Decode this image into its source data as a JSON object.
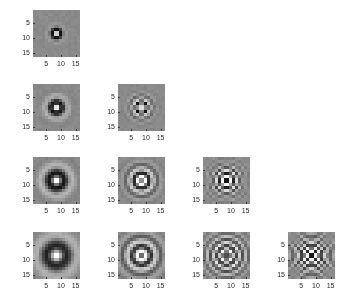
{
  "figure": {
    "title": "",
    "background_color": "#ffffff",
    "width": 364,
    "height": 305,
    "layout": "lower-triangular grid, 4 rows x 4 columns, 10 panels"
  },
  "axis": {
    "x_ticks": [
      "5",
      "10",
      "15"
    ],
    "y_ticks": [
      "5",
      "10",
      "15"
    ],
    "x_tick_values": [
      5,
      10,
      15
    ],
    "y_tick_values": [
      5,
      10,
      15
    ],
    "x_range": [
      1,
      16
    ],
    "y_range": [
      1,
      16
    ],
    "tick_color": "#2b2b2b",
    "tick_font_size": 7
  },
  "colormap": {
    "name": "gray",
    "low_color": "#000000",
    "mid_color": "#8a8a8a",
    "high_color": "#ffffff"
  },
  "chart_data": {
    "type": "heatmap",
    "title": "",
    "xlabel": "",
    "ylabel": "",
    "grid": false,
    "legend": "none",
    "colormap": "gray",
    "image_size": [
      16,
      16
    ],
    "xlim": [
      1,
      16
    ],
    "ylim": [
      1,
      16
    ],
    "xticks": [
      5,
      10,
      15
    ],
    "yticks": [
      5,
      10,
      15
    ],
    "grid_shape": [
      4,
      4
    ],
    "grid_type": "lower-triangular",
    "panel_count": 10,
    "panels": [
      {
        "id": "panel-r1c1",
        "row": 1,
        "col": 1,
        "sigma": 1.5,
        "frequency": 0.55,
        "rings": 1,
        "center_value": 1.0,
        "description": "tiny bright center dot with a single dark ring, flat mid-gray surround"
      },
      {
        "id": "panel-r2c1",
        "row": 2,
        "col": 1,
        "sigma": 2.4,
        "frequency": 0.45,
        "rings": 1,
        "center_value": 1.0,
        "description": "bright center blob with one broad dark ring"
      },
      {
        "id": "panel-r2c2",
        "row": 2,
        "col": 2,
        "sigma": 2.4,
        "frequency": 0.95,
        "rings": 2,
        "center_value": -1.0,
        "description": "dark checkered center with bright surrounding ring, two visible cycles"
      },
      {
        "id": "panel-r3c1",
        "row": 3,
        "col": 1,
        "sigma": 3.4,
        "frequency": 0.34,
        "rings": 1,
        "center_value": 1.0,
        "description": "large soft bright center with a single wide dark ring"
      },
      {
        "id": "panel-r3c2",
        "row": 3,
        "col": 2,
        "sigma": 3.4,
        "frequency": 0.72,
        "rings": 2,
        "center_value": -1.0,
        "description": "dark center with bright ring and faint outer dark ring"
      },
      {
        "id": "panel-r3c3",
        "row": 3,
        "col": 3,
        "sigma": 3.4,
        "frequency": 1.15,
        "rings": 3,
        "center_value": 1.0,
        "description": "bright center dot with multiple alternating concentric rings"
      },
      {
        "id": "panel-r4c1",
        "row": 4,
        "col": 1,
        "sigma": 4.6,
        "frequency": 0.26,
        "rings": 1,
        "center_value": 1.0,
        "description": "very large soft bright blob with broad dark halo filling the tile"
      },
      {
        "id": "panel-r4c2",
        "row": 4,
        "col": 2,
        "sigma": 4.6,
        "frequency": 0.6,
        "rings": 2,
        "center_value": -1.0,
        "description": "bright core inside a thick dark annulus, then a bright outer ring"
      },
      {
        "id": "panel-r4c3",
        "row": 4,
        "col": 3,
        "sigma": 4.6,
        "frequency": 0.92,
        "rings": 3,
        "center_value": 1.0,
        "description": "bright square center, dark ring, bright ring, dark outer ring"
      },
      {
        "id": "panel-r4c4",
        "row": 4,
        "col": 4,
        "sigma": 4.6,
        "frequency": 1.35,
        "rings": 4,
        "center_value": 1.0,
        "description": "many tight alternating concentric rings, highest radial frequency"
      }
    ]
  },
  "panel_geometry": [
    {
      "id": "panel-r1c1",
      "left": 33,
      "top": 10,
      "size": 47
    },
    {
      "id": "panel-r2c1",
      "left": 33,
      "top": 84,
      "size": 47
    },
    {
      "id": "panel-r2c2",
      "left": 118,
      "top": 84,
      "size": 47
    },
    {
      "id": "panel-r3c1",
      "left": 33,
      "top": 157,
      "size": 47
    },
    {
      "id": "panel-r3c2",
      "left": 118,
      "top": 157,
      "size": 47
    },
    {
      "id": "panel-r3c3",
      "left": 203,
      "top": 157,
      "size": 47
    },
    {
      "id": "panel-r4c1",
      "left": 33,
      "top": 232,
      "size": 47
    },
    {
      "id": "panel-r4c2",
      "left": 118,
      "top": 232,
      "size": 47
    },
    {
      "id": "panel-r4c3",
      "left": 203,
      "top": 232,
      "size": 47
    },
    {
      "id": "panel-r4c4",
      "left": 288,
      "top": 232,
      "size": 47
    }
  ]
}
